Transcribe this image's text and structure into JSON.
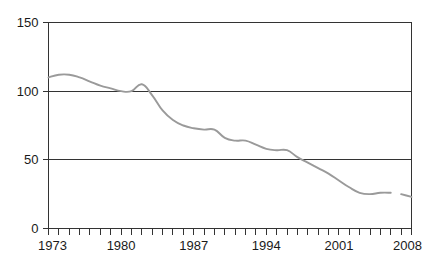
{
  "chart_data": {
    "type": "line",
    "title": "",
    "subtitle": "",
    "xlabel": "",
    "ylabel": "",
    "xlim": [
      1973,
      2008
    ],
    "ylim": [
      0,
      150
    ],
    "grid": true,
    "grid_axis": "y",
    "legend": "none",
    "line_color": "#9a9a9a",
    "axis_color": "#333333",
    "background_color": "#ffffff",
    "y_ticks": [
      0,
      50,
      100,
      150
    ],
    "y_tick_labels": [
      "0",
      "50",
      "100",
      "150"
    ],
    "x_ticks": [
      1973,
      1974,
      1975,
      1976,
      1977,
      1978,
      1979,
      1980,
      1981,
      1982,
      1983,
      1984,
      1985,
      1986,
      1987,
      1988,
      1989,
      1990,
      1991,
      1992,
      1993,
      1994,
      1995,
      1996,
      1997,
      1998,
      1999,
      2000,
      2001,
      2002,
      2003,
      2004,
      2005,
      2006,
      2007,
      2008
    ],
    "x_tick_labels_shown": [
      "1973",
      "1980",
      "1987",
      "1994",
      "2001",
      "2008"
    ],
    "x_labeled_values": [
      1973,
      1980,
      1987,
      1994,
      2001,
      2008
    ],
    "series": [
      {
        "name": "series-1",
        "color": "#9a9a9a",
        "x": [
          1973,
          1974,
          1975,
          1976,
          1977,
          1978,
          1979,
          1980,
          1981,
          1982,
          1983,
          1984,
          1985,
          1986,
          1987,
          1988,
          1989,
          1990,
          1991,
          1992,
          1993,
          1994,
          1995,
          1996,
          1997,
          1998,
          1999,
          2000,
          2001,
          2002,
          2003,
          2004,
          2005,
          2006
        ],
        "values": [
          110,
          112,
          112,
          110,
          107,
          104,
          102,
          100,
          100,
          105,
          97,
          86,
          79,
          75,
          73,
          72,
          72,
          66,
          64,
          64,
          61,
          58,
          57,
          57,
          52,
          48,
          44,
          40,
          35,
          30,
          26,
          25,
          26,
          26
        ]
      },
      {
        "name": "series-1-continued",
        "color": "#9a9a9a",
        "x": [
          2007,
          2008
        ],
        "values": [
          25,
          23
        ]
      }
    ]
  },
  "axis": {
    "y_labels": [
      "150",
      "100",
      "50",
      "0"
    ],
    "x_labels": [
      "1973",
      "1980",
      "1987",
      "1994",
      "2001",
      "2008"
    ]
  }
}
